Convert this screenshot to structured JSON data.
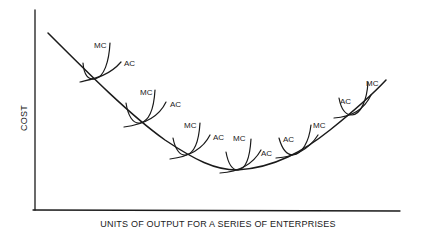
{
  "diagram": {
    "type": "long-run average cost envelope",
    "y_axis_label": "COST",
    "x_axis_label": "UNITS OF OUTPUT FOR A SERIES OF ENTERPRISES",
    "curve_labels": {
      "mc": "MC",
      "ac": "AC"
    },
    "enterprises": [
      {
        "id": 1,
        "mc_label": "MC",
        "ac_label": "AC"
      },
      {
        "id": 2,
        "mc_label": "MC",
        "ac_label": "AC"
      },
      {
        "id": 3,
        "mc_label": "MC",
        "ac_label": "AC"
      },
      {
        "id": 4,
        "mc_label": "MC",
        "ac_label": "AC"
      },
      {
        "id": 5,
        "mc_label": "MC",
        "ac_label": "AC"
      },
      {
        "id": 6,
        "mc_label": "MC",
        "ac_label": "AC"
      }
    ],
    "line_color": "#1a1a1a",
    "background": "#ffffff"
  }
}
